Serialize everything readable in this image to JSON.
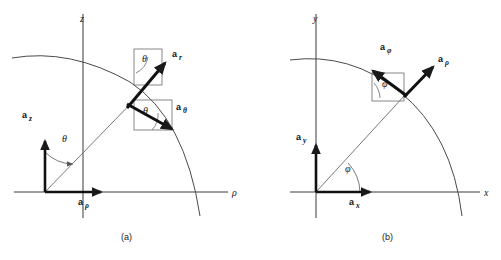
{
  "figure": {
    "background_color": "#ffffff",
    "stroke_color": "#1a1a1a",
    "thin_stroke_color": "#4a4a4a"
  },
  "panels": [
    {
      "id": "a",
      "caption": "(a)",
      "coordinate_system": "spherical",
      "axes": [
        {
          "name": "vertical-axis",
          "label": "z",
          "label_x": 80,
          "label_y": 22,
          "x1": 83,
          "y1": 14,
          "x2": 83,
          "y2": 218
        },
        {
          "name": "horizontal-axis",
          "label": "ρ",
          "label_x": 232,
          "label_y": 196,
          "x1": 14,
          "y1": 192,
          "x2": 228,
          "y2": 192
        }
      ],
      "origin": {
        "x": 45,
        "y": 192
      },
      "arc": {
        "start_x": 12,
        "start_y": 58,
        "end_x": 200,
        "end_y": 216,
        "radius": 158
      },
      "radial_line": {
        "x1": 45,
        "y1": 192,
        "x2": 143,
        "y2": 91
      },
      "origin_vectors": [
        {
          "name": "a-z",
          "label": "a",
          "sub": "z",
          "label_x": 22,
          "label_y": 118,
          "x1": 45,
          "y1": 192,
          "x2": 45,
          "y2": 139
        },
        {
          "name": "a-rho",
          "label": "a",
          "sub": "ρ",
          "label_x": 78,
          "label_y": 205,
          "x1": 45,
          "y1": 192,
          "x2": 103,
          "y2": 192
        }
      ],
      "point_vectors": [
        {
          "name": "a-r",
          "label": "a",
          "sub": "r",
          "label_x": 172,
          "label_y": 57,
          "x1": 129,
          "y1": 106,
          "x2": 167,
          "y2": 62
        },
        {
          "name": "a-theta",
          "label": "a",
          "sub": "θ",
          "label_x": 176,
          "label_y": 110,
          "x1": 129,
          "y1": 106,
          "x2": 173,
          "y2": 130
        }
      ],
      "angle_labels": [
        {
          "name": "theta-origin",
          "label": "θ",
          "x": 62,
          "y": 142
        },
        {
          "name": "theta-upper",
          "label": "θ",
          "x": 142,
          "y": 62
        },
        {
          "name": "theta-lower",
          "label": "θ",
          "x": 143,
          "y": 114
        }
      ],
      "angle_boxes": [
        {
          "name": "upper-angle-box",
          "x": 134,
          "y": 49,
          "width": 28,
          "height": 36
        },
        {
          "name": "lower-angle-box",
          "x": 134,
          "y": 100,
          "width": 38,
          "height": 30
        }
      ]
    },
    {
      "id": "b",
      "caption": "(b)",
      "coordinate_system": "cylindrical",
      "axes": [
        {
          "name": "vertical-axis",
          "label": "y",
          "label_x": 313,
          "label_y": 22,
          "x1": 316,
          "y1": 14,
          "x2": 316,
          "y2": 218
        },
        {
          "name": "horizontal-axis",
          "label": "x",
          "label_x": 484,
          "label_y": 196,
          "x1": 290,
          "y1": 192,
          "x2": 480,
          "y2": 192
        }
      ],
      "origin": {
        "x": 316,
        "y": 192
      },
      "arc": {
        "start_x": 290,
        "start_y": 60,
        "end_x": 462,
        "end_y": 216,
        "radius": 152
      },
      "radial_line": {
        "x1": 316,
        "y1": 192,
        "x2": 405,
        "y2": 95
      },
      "origin_vectors": [
        {
          "name": "a-y",
          "label": "a",
          "sub": "y",
          "label_x": 296,
          "label_y": 140,
          "x1": 316,
          "y1": 192,
          "x2": 316,
          "y2": 143
        },
        {
          "name": "a-x",
          "label": "a",
          "sub": "x",
          "label_x": 349,
          "label_y": 205,
          "x1": 316,
          "y1": 192,
          "x2": 372,
          "y2": 192
        }
      ],
      "point_vectors": [
        {
          "name": "a-phi",
          "label": "a",
          "sub": "φ",
          "label_x": 380,
          "label_y": 50,
          "x1": 405,
          "y1": 95,
          "x2": 371,
          "y2": 70
        },
        {
          "name": "a-rho",
          "label": "a",
          "sub": "ρ",
          "label_x": 438,
          "label_y": 62,
          "x1": 405,
          "y1": 95,
          "x2": 434,
          "y2": 66
        }
      ],
      "angle_labels": [
        {
          "name": "phi-origin",
          "label": "φ",
          "x": 345,
          "y": 172
        },
        {
          "name": "phi-vector",
          "label": "φ",
          "x": 382,
          "y": 87
        }
      ],
      "angle_boxes": [
        {
          "name": "phi-angle-box",
          "x": 372,
          "y": 73,
          "width": 32,
          "height": 28
        }
      ]
    }
  ]
}
